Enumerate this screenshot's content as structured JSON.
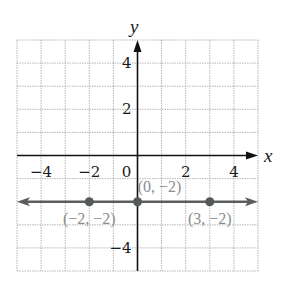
{
  "chart_data": {
    "type": "line",
    "title": "",
    "xlabel": "x",
    "ylabel": "y",
    "xlim": [
      -5,
      5
    ],
    "ylim": [
      -5,
      5
    ],
    "grid": true,
    "x_ticks": [
      -4,
      -2,
      0,
      2,
      4
    ],
    "y_ticks": [
      4,
      2,
      -4
    ],
    "x_tick_labels": [
      "−4",
      "−2",
      "0",
      "2",
      "4"
    ],
    "y_tick_labels": [
      "4",
      "2",
      "−4"
    ],
    "series": [
      {
        "name": "y = -2",
        "kind": "horizontal line (arrows both ends)",
        "y": -2,
        "color": "#5a5f5c"
      }
    ],
    "points": [
      {
        "x": -2,
        "y": -2,
        "label": "(−2, −2)"
      },
      {
        "x": 0,
        "y": -2,
        "label": "(0, −2)"
      },
      {
        "x": 3,
        "y": -2,
        "label": "(3, −2)"
      }
    ],
    "colors": {
      "grid": "#b5b5b5",
      "axes": "#111111",
      "line": "#5a5f5c",
      "point": "#555a58",
      "point_label": "#8a8e8e"
    }
  }
}
